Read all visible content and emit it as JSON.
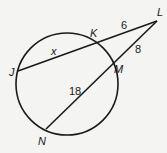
{
  "diagram": {
    "type": "secant-secant geometry figure",
    "colors": {
      "stroke": "#1a1a1a",
      "background": "#f4f4f2"
    },
    "circle": {
      "cx": 67,
      "cy": 84,
      "r": 51
    },
    "points": {
      "J": {
        "label": "J",
        "x": 18,
        "y": 71
      },
      "K": {
        "label": "K",
        "x": 95,
        "y": 41
      },
      "L": {
        "label": "L",
        "x": 157,
        "y": 21
      },
      "M": {
        "label": "M",
        "x": 111,
        "y": 66
      },
      "N": {
        "label": "N",
        "x": 46,
        "y": 129
      }
    },
    "segments": [
      {
        "from": "J",
        "to": "L"
      },
      {
        "from": "N",
        "to": "L"
      }
    ],
    "measures": {
      "JK": "x",
      "KL": "6",
      "LM": "8",
      "MN": "18"
    }
  }
}
